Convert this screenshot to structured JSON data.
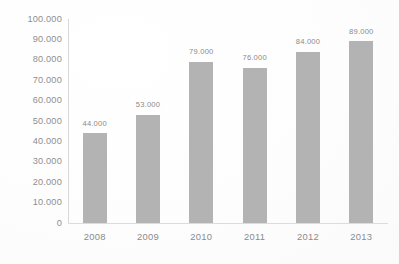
{
  "chart_data": {
    "type": "bar",
    "title": "",
    "subtitle": "",
    "xlabel": "",
    "ylabel": "",
    "categories": [
      "2008",
      "2009",
      "2010",
      "2011",
      "2012",
      "2013"
    ],
    "values": [
      44000,
      53000,
      79000,
      76000,
      84000,
      89000
    ],
    "value_labels": [
      "44.000",
      "53.000",
      "79.000",
      "76.000",
      "84.000",
      "89.000"
    ],
    "ylim": [
      0,
      100000
    ],
    "ytick_values": [
      0,
      10000,
      20000,
      30000,
      40000,
      50000,
      60000,
      70000,
      80000,
      90000,
      100000
    ],
    "ytick_labels": [
      "0",
      "10.000",
      "20.000",
      "30.000",
      "40.000",
      "50.000",
      "60.000",
      "70.000",
      "80.000",
      "90.000",
      "100.000"
    ],
    "grid": false,
    "legend": false,
    "legend_position": "none",
    "series": [
      {
        "name": "",
        "values": [
          44000,
          53000,
          79000,
          76000,
          84000,
          89000
        ]
      }
    ]
  },
  "colors": {
    "bar": "#b3b3b3",
    "axis_line": "#d8d8d8",
    "baseline": "#dcdcdc",
    "tick_text": "#8e8e8e",
    "value_text": "#8a8a8a",
    "background": "#fefefe"
  }
}
